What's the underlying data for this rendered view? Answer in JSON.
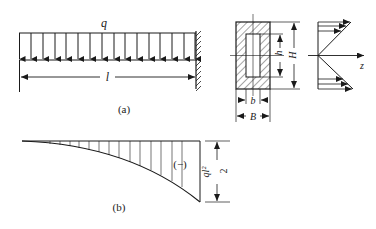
{
  "figure_a": {
    "load_label": "q",
    "length_label": "l",
    "caption": "(a)",
    "arrow_count": 16
  },
  "cross_section": {
    "outer_height_label": "H",
    "inner_height_label": "h",
    "inner_width_label": "b",
    "outer_width_label": "B"
  },
  "stress_diagram": {
    "axis_label": "z"
  },
  "figure_b": {
    "sign_label": "(−)",
    "moment_numerator": "ql²",
    "moment_denominator": "2",
    "caption": "(b)"
  },
  "colors": {
    "ink": "#1a1a1a",
    "background": "#ffffff"
  }
}
